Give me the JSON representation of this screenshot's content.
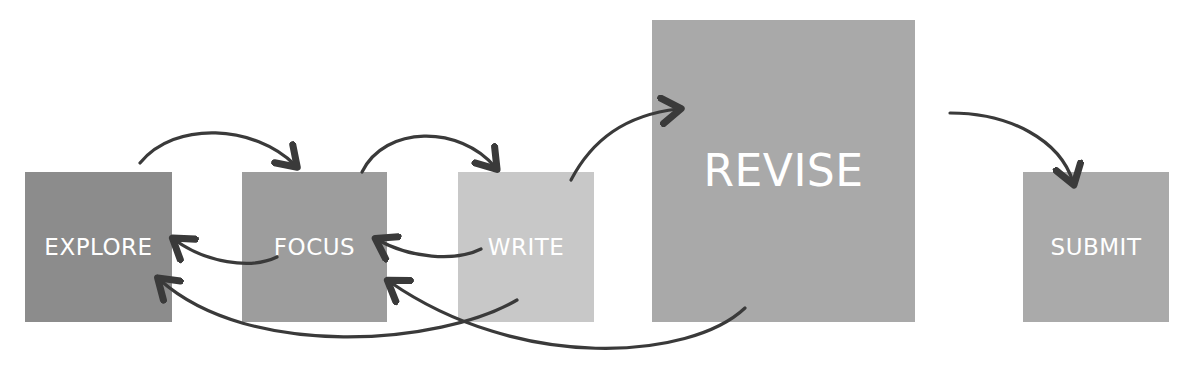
{
  "diagram": {
    "type": "process-flow",
    "colors": {
      "explore": "#8c8c8c",
      "focus": "#9d9d9d",
      "write": "#c8c8c8",
      "revise": "#a9a9a9",
      "submit": "#aaaaaa",
      "arrow": "#3a3a3a",
      "label": "#ffffff"
    },
    "nodes": [
      {
        "id": "explore",
        "label": "EXPLORE"
      },
      {
        "id": "focus",
        "label": "FOCUS"
      },
      {
        "id": "write",
        "label": "WRITE"
      },
      {
        "id": "revise",
        "label": "REVISE"
      },
      {
        "id": "submit",
        "label": "SUBMIT"
      }
    ],
    "edges": [
      {
        "from": "explore",
        "to": "focus"
      },
      {
        "from": "focus",
        "to": "write"
      },
      {
        "from": "write",
        "to": "revise"
      },
      {
        "from": "revise",
        "to": "submit"
      },
      {
        "from": "focus",
        "to": "explore"
      },
      {
        "from": "write",
        "to": "focus"
      },
      {
        "from": "write",
        "to": "explore"
      },
      {
        "from": "revise",
        "to": "focus"
      }
    ]
  }
}
